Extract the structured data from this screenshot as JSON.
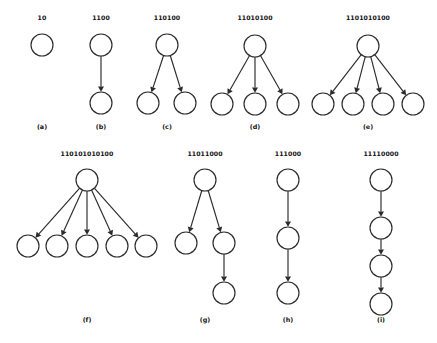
{
  "figure": {
    "background_color": "#ffffff",
    "stroke_color": "#2b2b2b",
    "text_color": "#111111",
    "node_radius": 11,
    "panels": [
      {
        "id": "a",
        "caption": "(a)",
        "binary_label": "10",
        "label_pos": [
          42,
          20
        ],
        "caption_pos": [
          42,
          129
        ],
        "nodes": [
          {
            "name": "root",
            "cx": 42,
            "cy": 45
          }
        ],
        "edges": []
      },
      {
        "id": "b",
        "caption": "(b)",
        "binary_label": "1100",
        "label_pos": [
          101,
          20
        ],
        "caption_pos": [
          101,
          129
        ],
        "nodes": [
          {
            "name": "root",
            "cx": 101,
            "cy": 45
          },
          {
            "name": "child-1",
            "cx": 101,
            "cy": 103
          }
        ],
        "edges": [
          {
            "from": 0,
            "to": 1
          }
        ]
      },
      {
        "id": "c",
        "caption": "(c)",
        "binary_label": "110100",
        "label_pos": [
          167,
          20
        ],
        "caption_pos": [
          167,
          129
        ],
        "nodes": [
          {
            "name": "root",
            "cx": 167,
            "cy": 45
          },
          {
            "name": "child-1",
            "cx": 148,
            "cy": 103
          },
          {
            "name": "child-2",
            "cx": 185,
            "cy": 103
          }
        ],
        "edges": [
          {
            "from": 0,
            "to": 1
          },
          {
            "from": 0,
            "to": 2
          }
        ]
      },
      {
        "id": "d",
        "caption": "(d)",
        "binary_label": "11010100",
        "label_pos": [
          255,
          20
        ],
        "caption_pos": [
          255,
          129
        ],
        "nodes": [
          {
            "name": "root",
            "cx": 255,
            "cy": 46
          },
          {
            "name": "child-1",
            "cx": 222,
            "cy": 104
          },
          {
            "name": "child-2",
            "cx": 255,
            "cy": 104
          },
          {
            "name": "child-3",
            "cx": 288,
            "cy": 104
          }
        ],
        "edges": [
          {
            "from": 0,
            "to": 1
          },
          {
            "from": 0,
            "to": 2
          },
          {
            "from": 0,
            "to": 3
          }
        ]
      },
      {
        "id": "e",
        "caption": "(e)",
        "binary_label": "1101010100",
        "label_pos": [
          368,
          20
        ],
        "caption_pos": [
          368,
          129
        ],
        "nodes": [
          {
            "name": "root",
            "cx": 368,
            "cy": 46
          },
          {
            "name": "child-1",
            "cx": 323,
            "cy": 104
          },
          {
            "name": "child-2",
            "cx": 353,
            "cy": 104
          },
          {
            "name": "child-3",
            "cx": 383,
            "cy": 104
          },
          {
            "name": "child-4",
            "cx": 413,
            "cy": 104
          }
        ],
        "edges": [
          {
            "from": 0,
            "to": 1
          },
          {
            "from": 0,
            "to": 2
          },
          {
            "from": 0,
            "to": 3
          },
          {
            "from": 0,
            "to": 4
          }
        ]
      },
      {
        "id": "f",
        "caption": "(f)",
        "binary_label": "110101010100",
        "label_pos": [
          87,
          156
        ],
        "caption_pos": [
          87,
          322
        ],
        "nodes": [
          {
            "name": "root",
            "cx": 87,
            "cy": 180
          },
          {
            "name": "child-1",
            "cx": 28,
            "cy": 246
          },
          {
            "name": "child-2",
            "cx": 57,
            "cy": 246
          },
          {
            "name": "child-3",
            "cx": 87,
            "cy": 246
          },
          {
            "name": "child-4",
            "cx": 117,
            "cy": 246
          },
          {
            "name": "child-5",
            "cx": 146,
            "cy": 246
          }
        ],
        "edges": [
          {
            "from": 0,
            "to": 1
          },
          {
            "from": 0,
            "to": 2
          },
          {
            "from": 0,
            "to": 3
          },
          {
            "from": 0,
            "to": 4
          },
          {
            "from": 0,
            "to": 5
          }
        ]
      },
      {
        "id": "g",
        "caption": "(g)",
        "binary_label": "11011000",
        "label_pos": [
          205,
          156
        ],
        "caption_pos": [
          205,
          322
        ],
        "nodes": [
          {
            "name": "root",
            "cx": 205,
            "cy": 180
          },
          {
            "name": "child-1",
            "cx": 186,
            "cy": 243
          },
          {
            "name": "child-2",
            "cx": 224,
            "cy": 243
          },
          {
            "name": "grandchild-1",
            "cx": 224,
            "cy": 293
          }
        ],
        "edges": [
          {
            "from": 0,
            "to": 1
          },
          {
            "from": 0,
            "to": 2
          },
          {
            "from": 2,
            "to": 3
          }
        ]
      },
      {
        "id": "h",
        "caption": "(h)",
        "binary_label": "111000",
        "label_pos": [
          288,
          156
        ],
        "caption_pos": [
          288,
          322
        ],
        "nodes": [
          {
            "name": "root",
            "cx": 288,
            "cy": 180
          },
          {
            "name": "child-1",
            "cx": 288,
            "cy": 238
          },
          {
            "name": "child-2",
            "cx": 288,
            "cy": 293
          }
        ],
        "edges": [
          {
            "from": 0,
            "to": 1
          },
          {
            "from": 1,
            "to": 2
          }
        ]
      },
      {
        "id": "i",
        "caption": "(i)",
        "binary_label": "11110000",
        "label_pos": [
          381,
          156
        ],
        "caption_pos": [
          381,
          322
        ],
        "nodes": [
          {
            "name": "root",
            "cx": 381,
            "cy": 180
          },
          {
            "name": "child-1",
            "cx": 381,
            "cy": 228
          },
          {
            "name": "child-2",
            "cx": 381,
            "cy": 266
          },
          {
            "name": "child-3",
            "cx": 381,
            "cy": 304
          }
        ],
        "edges": [
          {
            "from": 0,
            "to": 1
          },
          {
            "from": 1,
            "to": 2
          },
          {
            "from": 2,
            "to": 3
          }
        ]
      }
    ]
  }
}
